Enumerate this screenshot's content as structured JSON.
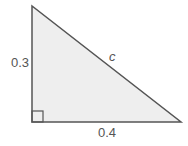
{
  "diagram": {
    "type": "right-triangle",
    "fill_color": "#eeeeee",
    "stroke_color": "#555555",
    "vertical_side_label": "0.3",
    "horizontal_side_label": "0.4",
    "hypotenuse_label": "c",
    "right_angle_marker": true
  }
}
